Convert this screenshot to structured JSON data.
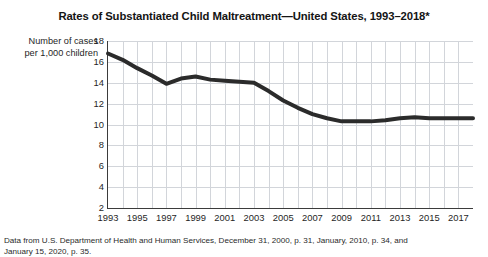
{
  "chart_data": {
    "type": "line",
    "title": "Rates of Substantiated Child Maltreatment—United States, 1993–2018*",
    "xlabel": "",
    "ylabel": "Number of cases per 1,000 children",
    "ylabel_lines": [
      "Number of cases",
      "per 1,000 children"
    ],
    "ylim": [
      2,
      18
    ],
    "ytick_values": [
      2,
      4,
      6,
      8,
      10,
      12,
      14,
      16,
      18
    ],
    "xlim": [
      1993,
      2018
    ],
    "xtick_values": [
      1993,
      1995,
      1997,
      1999,
      2001,
      2003,
      2005,
      2007,
      2009,
      2011,
      2013,
      2015,
      2017
    ],
    "grid": true,
    "legend": "none",
    "line_color": "#2b2b2b",
    "line_width": 4,
    "x": [
      1993,
      1994,
      1995,
      1996,
      1997,
      1998,
      1999,
      2000,
      2001,
      2002,
      2003,
      2004,
      2005,
      2006,
      2007,
      2008,
      2009,
      2010,
      2011,
      2012,
      2013,
      2014,
      2015,
      2016,
      2017,
      2018
    ],
    "values": [
      16.8,
      16.2,
      15.4,
      14.7,
      13.9,
      14.4,
      14.6,
      14.3,
      14.2,
      14.1,
      14.0,
      13.2,
      12.3,
      11.6,
      11.0,
      10.6,
      10.3,
      10.3,
      10.3,
      10.4,
      10.6,
      10.7,
      10.6,
      10.6,
      10.6,
      10.6
    ],
    "series": [
      {
        "name": "Substantiated child maltreatment rate",
        "values": [
          16.8,
          16.2,
          15.4,
          14.7,
          13.9,
          14.4,
          14.6,
          14.3,
          14.2,
          14.1,
          14.0,
          13.2,
          12.3,
          11.6,
          11.0,
          10.6,
          10.3,
          10.3,
          10.3,
          10.4,
          10.6,
          10.7,
          10.6,
          10.6,
          10.6,
          10.6
        ]
      }
    ]
  },
  "source_note": {
    "line1": "Data from U.S. Department of Health and Human Services, December 31, 2000, p. 31, January, 2010, p. 34, and",
    "line2": "January 15, 2020, p. 35."
  }
}
